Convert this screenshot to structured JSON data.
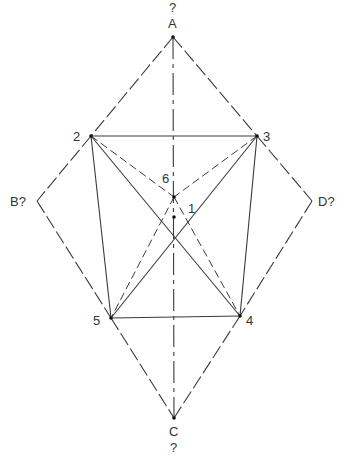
{
  "diagram": {
    "type": "geometric-construction",
    "points": {
      "A": {
        "label": "A",
        "x": 173,
        "y": 37,
        "lx": 168,
        "ly": 28,
        "q": "?",
        "qx": 169,
        "qy": 12
      },
      "C": {
        "label": "C",
        "x": 174,
        "y": 418,
        "lx": 169,
        "ly": 436,
        "q": "?",
        "qx": 170,
        "qy": 452
      },
      "B": {
        "label": "B?",
        "x": 37,
        "y": 201,
        "lx": 10,
        "ly": 206
      },
      "D": {
        "label": "D?",
        "x": 312,
        "y": 201,
        "lx": 318,
        "ly": 206
      },
      "P2": {
        "label": "2",
        "x": 91,
        "y": 136,
        "lx": 73,
        "ly": 141
      },
      "P3": {
        "label": "3",
        "x": 257,
        "y": 136,
        "lx": 263,
        "ly": 141
      },
      "P4": {
        "label": "4",
        "x": 240,
        "y": 316,
        "lx": 246,
        "ly": 325
      },
      "P5": {
        "label": "5",
        "x": 111,
        "y": 318,
        "lx": 93,
        "ly": 325
      },
      "P6": {
        "label": "6",
        "x": 174,
        "y": 197,
        "lx": 162,
        "ly": 183
      },
      "P1": {
        "label": "1",
        "x": 174,
        "y": 217,
        "lx": 188,
        "ly": 213
      }
    },
    "labels": {
      "A": "A",
      "A_q": "?",
      "C": "C",
      "C_q": "?",
      "B": "B?",
      "D": "D?",
      "p1": "1",
      "p2": "2",
      "p3": "3",
      "p4": "4",
      "p5": "5",
      "p6": "6"
    },
    "segments": [
      {
        "from": "A",
        "to": "P2",
        "style": "dashed"
      },
      {
        "from": "P2",
        "to": "B",
        "style": "dashed"
      },
      {
        "from": "B",
        "to": "P5",
        "style": "dashed"
      },
      {
        "from": "P5",
        "to": "C",
        "style": "dashed"
      },
      {
        "from": "A",
        "to": "P3",
        "style": "dashed"
      },
      {
        "from": "P3",
        "to": "D",
        "style": "dashed"
      },
      {
        "from": "D",
        "to": "P4",
        "style": "dashed"
      },
      {
        "from": "P4",
        "to": "C",
        "style": "dashed"
      },
      {
        "from": "A",
        "to": "C",
        "style": "dashdot"
      },
      {
        "from": "P2",
        "to": "P3",
        "style": "solid"
      },
      {
        "from": "P5",
        "to": "P4",
        "style": "solid"
      },
      {
        "from": "P2",
        "to": "P5",
        "style": "solid"
      },
      {
        "from": "P3",
        "to": "P4",
        "style": "solid"
      },
      {
        "from": "P2",
        "to": "P4",
        "style": "solid"
      },
      {
        "from": "P3",
        "to": "P5",
        "style": "solid"
      },
      {
        "from": "P2",
        "to": "P6",
        "style": "dashed-fine"
      },
      {
        "from": "P3",
        "to": "P6",
        "style": "dashed-fine"
      },
      {
        "from": "P6",
        "to": "P5",
        "style": "dashed-fine"
      },
      {
        "from": "P6",
        "to": "P4",
        "style": "dashed-fine"
      }
    ]
  }
}
